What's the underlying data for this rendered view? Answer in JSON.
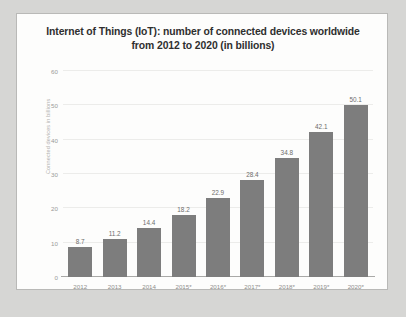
{
  "chart_data": {
    "type": "bar",
    "title": "Internet of Things (IoT): number of connected devices worldwide from 2012 to 2020 (in billions)",
    "title_lines": [
      "Internet of Things (IoT): number of connected devices worldwide",
      "from 2012 to 2020 (in billions)"
    ],
    "xlabel": "",
    "ylabel": "Connected devices in billions",
    "ylim": [
      0,
      60
    ],
    "yticks": [
      0,
      10,
      20,
      30,
      40,
      50,
      60
    ],
    "grid": true,
    "legend": null,
    "categories": [
      "2012",
      "2013",
      "2014",
      "2015*",
      "2016*",
      "2017*",
      "2018*",
      "2019*",
      "2020*"
    ],
    "values": [
      8.7,
      11.2,
      14.4,
      18.2,
      22.9,
      28.4,
      34.8,
      42.1,
      50.1
    ],
    "value_labels": [
      "8.7",
      "11.2",
      "14.4",
      "18.2",
      "22.9",
      "28.4",
      "34.8",
      "42.1",
      "50.1"
    ],
    "bar_color": "#7d7d7d",
    "panel_background": "#fdfdfc",
    "canvas_background": "#d6d6d4"
  }
}
